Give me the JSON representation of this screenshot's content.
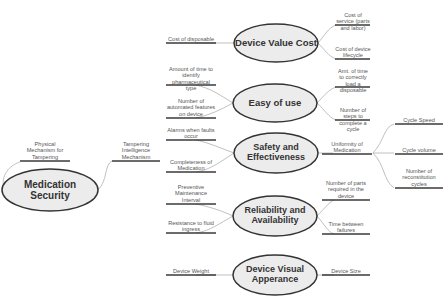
{
  "root": {
    "label": "Medication Security"
  },
  "root_branches": [
    {
      "label": "Physical Mechanism for Tampering"
    },
    {
      "label": "Tampering Intelligence Mechanism"
    }
  ],
  "categories": [
    {
      "label": "Device Value Cost",
      "left": [
        {
          "label": "Cost of disposable"
        }
      ],
      "right": [
        {
          "label": "Cost of service (parts and labor)"
        },
        {
          "label": "Cost of device lifecycle"
        }
      ]
    },
    {
      "label": "Easy of use",
      "left": [
        {
          "label": "Amount of time to identify pharmaceutical type"
        },
        {
          "label": "Number of automated features on device"
        }
      ],
      "right": [
        {
          "label": "Amt. of time to correctly load a disposable"
        },
        {
          "label": "Number of steps to complete a cycle"
        }
      ]
    },
    {
      "label": "Safety and Effectiveness",
      "left": [
        {
          "label": "Alarms when faults occur"
        },
        {
          "label": "Completeness of Medication"
        }
      ],
      "right": [
        {
          "label": "Uniformity of Medication",
          "children": [
            {
              "label": "Cycle Speed"
            },
            {
              "label": "Cycle volume"
            },
            {
              "label": "Number of reconstitution cycles"
            }
          ]
        }
      ]
    },
    {
      "label": "Reliability and Availability",
      "left": [
        {
          "label": "Preventive Maintenance Interval"
        },
        {
          "label": "Resistance to fluid ingress"
        }
      ],
      "right": [
        {
          "label": "Number of parts required in the device"
        },
        {
          "label": "Time between failures"
        }
      ]
    },
    {
      "label": "Device Visual Apperance",
      "left": [
        {
          "label": "Device Weight"
        }
      ],
      "right": [
        {
          "label": "Device Size"
        }
      ]
    }
  ],
  "colors": {
    "ellipse_fill": "#ececec",
    "ellipse_stroke": "#333333",
    "line": "#444444",
    "connector": "#aaaaaa",
    "text": "#333333"
  }
}
